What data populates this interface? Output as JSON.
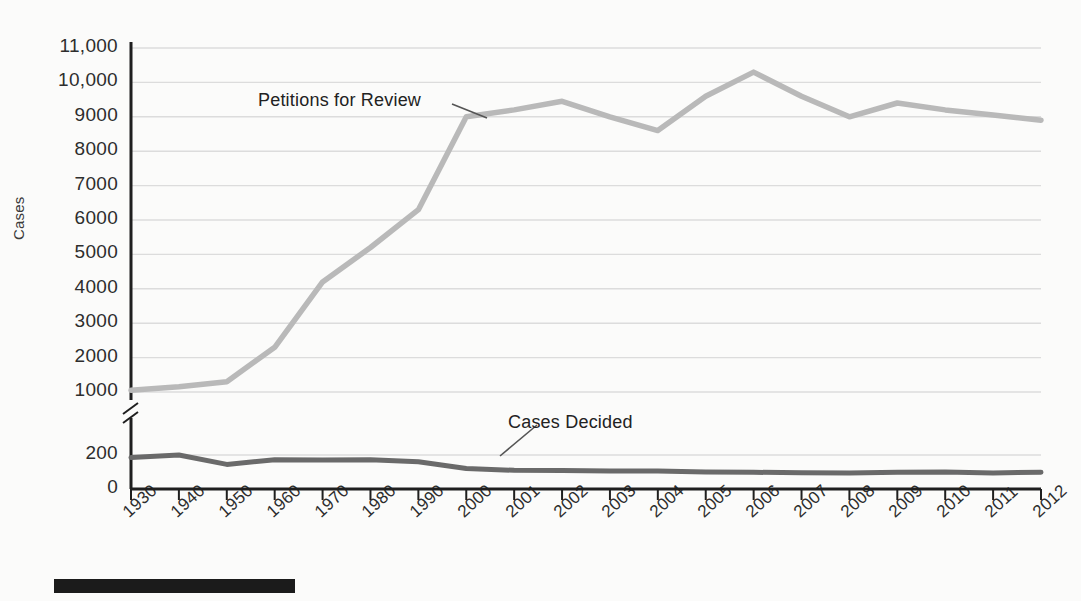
{
  "chart_data": {
    "type": "line",
    "title": "",
    "xlabel": "",
    "ylabel": "Cases",
    "categories": [
      "1930",
      "1940",
      "1950",
      "1960",
      "1970",
      "1980",
      "1990",
      "2000",
      "2001",
      "2002",
      "2003",
      "2004",
      "2005",
      "2006",
      "2007",
      "2008",
      "2009",
      "2010",
      "2011",
      "2012"
    ],
    "series": [
      {
        "name": "Petitions for Review",
        "color": "#b9b9b9",
        "values": [
          1050,
          1150,
          1300,
          2300,
          4200,
          5200,
          6300,
          9000,
          9200,
          9450,
          9000,
          8600,
          9600,
          10300,
          9600,
          9000,
          9400,
          9200,
          9050,
          8900
        ]
      },
      {
        "name": "Cases Decided",
        "color": "#6a6a6a",
        "values": [
          185,
          200,
          145,
          172,
          170,
          172,
          160,
          120,
          110,
          108,
          105,
          105,
          100,
          98,
          96,
          95,
          98,
          100,
          95,
          98
        ]
      }
    ],
    "y_ticks_upper": [
      "11,000",
      "10,000",
      "9000",
      "8000",
      "7000",
      "6000",
      "5000",
      "4000",
      "3000",
      "2000",
      "1000"
    ],
    "y_ticks_lower": [
      "200",
      "0"
    ],
    "ylim_upper": [
      1000,
      11000
    ],
    "ylim_lower": [
      0,
      200
    ],
    "axis_break": true,
    "grid": true,
    "legend_position": "inline-annotations",
    "annotations": [
      {
        "text": "Petitions for Review",
        "target_category": "2001"
      },
      {
        "text": "Cases Decided",
        "target_category": "2000"
      }
    ]
  },
  "colors": {
    "background": "#fbfbfa",
    "axis": "#1f1f1f",
    "grid": "#dcdcdc",
    "petitions_line": "#b9b9b9",
    "cases_line": "#6a6a6a",
    "text": "#2d2d2d",
    "footer_bar": "#1b1b1b"
  },
  "axis": {
    "y_title": "Cases",
    "x_labels": [
      "1930",
      "1940",
      "1950",
      "1960",
      "1970",
      "1980",
      "1990",
      "2000",
      "2001",
      "2002",
      "2003",
      "2004",
      "2005",
      "2006",
      "2007",
      "2008",
      "2009",
      "2010",
      "2011",
      "2012"
    ],
    "y_labels": [
      "11,000",
      "10,000",
      "9000",
      "8000",
      "7000",
      "6000",
      "5000",
      "4000",
      "3000",
      "2000",
      "1000",
      "200",
      "0"
    ]
  },
  "labels": {
    "petitions": "Petitions for Review",
    "cases_decided": "Cases Decided"
  }
}
